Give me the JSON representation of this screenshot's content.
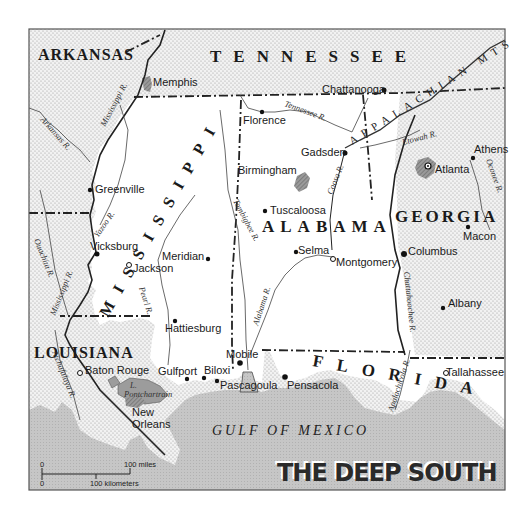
{
  "map": {
    "title": "THE DEEP SOUTH",
    "colors": {
      "focus_land": "#ffffff",
      "neighbor_land_dots": "#bdbdbd",
      "water": "#c8c8c8",
      "urban_area": "#8a8a8a",
      "border": "#222222",
      "frame": "#555555"
    },
    "states": [
      {
        "name": "ARKANSAS",
        "type": "neighbor"
      },
      {
        "name": "TENNESSEE",
        "type": "neighbor"
      },
      {
        "name": "MISSISSIPPI",
        "type": "focus"
      },
      {
        "name": "ALABAMA",
        "type": "focus"
      },
      {
        "name": "GEORGIA",
        "type": "neighbor"
      },
      {
        "name": "LOUISIANA",
        "type": "neighbor"
      },
      {
        "name": "FLORIDA",
        "type": "focus"
      }
    ],
    "cities": [
      {
        "name": "Memphis",
        "marker": "urban"
      },
      {
        "name": "Chattanooga",
        "marker": "dot"
      },
      {
        "name": "Florence",
        "marker": "dot"
      },
      {
        "name": "Gadsden",
        "marker": "dot"
      },
      {
        "name": "Birmingham",
        "marker": "urban"
      },
      {
        "name": "Athens",
        "marker": "dot"
      },
      {
        "name": "Atlanta",
        "marker": "capital"
      },
      {
        "name": "Greenville",
        "marker": "dot"
      },
      {
        "name": "Tuscaloosa",
        "marker": "dot"
      },
      {
        "name": "Macon",
        "marker": "dot"
      },
      {
        "name": "Vicksburg",
        "marker": "dot"
      },
      {
        "name": "Meridian",
        "marker": "dot"
      },
      {
        "name": "Jackson",
        "marker": "capital"
      },
      {
        "name": "Selma",
        "marker": "dot"
      },
      {
        "name": "Montgomery",
        "marker": "capital"
      },
      {
        "name": "Columbus",
        "marker": "dot"
      },
      {
        "name": "Hattiesburg",
        "marker": "dot"
      },
      {
        "name": "Albany",
        "marker": "dot"
      },
      {
        "name": "Mobile",
        "marker": "dot"
      },
      {
        "name": "Baton Rouge",
        "marker": "capital"
      },
      {
        "name": "Gulfport",
        "marker": "dot"
      },
      {
        "name": "Biloxi",
        "marker": "dot"
      },
      {
        "name": "Pascagoula",
        "marker": "dot"
      },
      {
        "name": "Pensacola",
        "marker": "dot"
      },
      {
        "name": "Tallahassee",
        "marker": "capital"
      },
      {
        "name": "New",
        "marker": "urban"
      },
      {
        "name": "Orleans",
        "marker": "none"
      }
    ],
    "rivers": [
      "Mississippi R.",
      "Arkansas R.",
      "Tennessee R.",
      "Etowah R.",
      "Oconee R.",
      "Yazoo R.",
      "Ouachita R.",
      "Tombigbee R.",
      "Coosa R.",
      "Pearl R.",
      "Alabama R.",
      "Chattahoochee R.",
      "Atchafalaya R.",
      "Apalachicola R."
    ],
    "lake": {
      "line1": "L.",
      "line2": "Pontchartrain"
    },
    "water_body": "GULF OF MEXICO",
    "mountain_range": "APPALACHIAN MTS",
    "scale": {
      "miles_zero": "0",
      "miles_label": "100 miles",
      "km_zero": "0",
      "km_label": "100 kilometers"
    }
  }
}
